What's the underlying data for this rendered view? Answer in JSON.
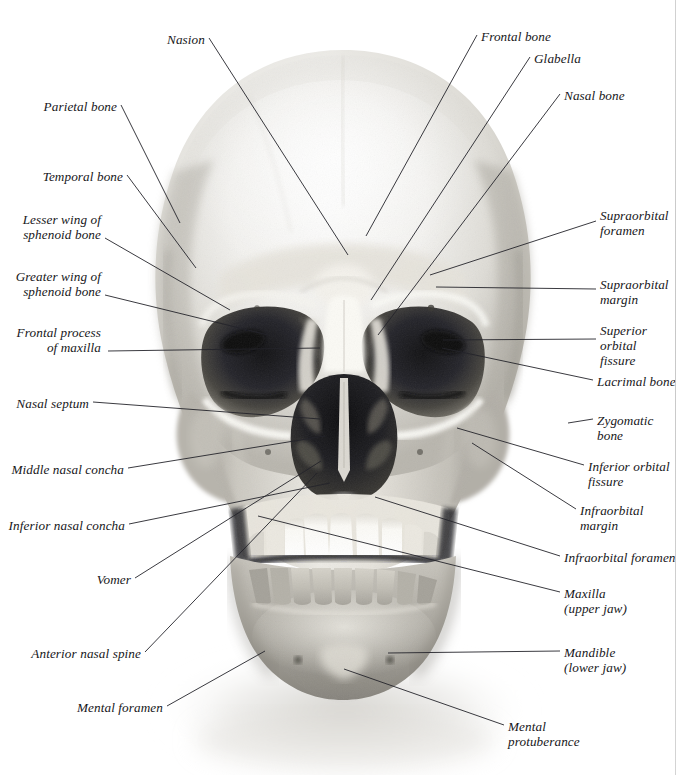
{
  "figure": {
    "view": "anterior (front) view",
    "medium": "black-and-white photograph",
    "page_rule_color": "#c9c9c9",
    "background_color": "#ffffff",
    "label_text_color": "#17171a",
    "leader_line_color": "#24242a"
  },
  "labels": [
    {
      "id": "nasion",
      "text": "Nasion",
      "side": "left",
      "x": 205,
      "y": 32,
      "align": "right",
      "lines": [
        "Nasion"
      ],
      "leader": [
        [
          209,
          38
        ],
        [
          348,
          255
        ]
      ]
    },
    {
      "id": "frontal-bone",
      "text": "Frontal bone",
      "side": "right",
      "x": 481,
      "y": 29,
      "align": "left",
      "lines": [
        "Frontal bone"
      ],
      "leader": [
        [
          477,
          35
        ],
        [
          366,
          236
        ]
      ]
    },
    {
      "id": "glabella",
      "text": "Glabella",
      "side": "right",
      "x": 534,
      "y": 51,
      "align": "left",
      "lines": [
        "Glabella"
      ],
      "leader": [
        [
          530,
          57
        ],
        [
          371,
          300
        ]
      ]
    },
    {
      "id": "nasal-bone",
      "text": "Nasal bone",
      "side": "right",
      "x": 564,
      "y": 88,
      "align": "left",
      "lines": [
        "Nasal bone"
      ],
      "leader": [
        [
          560,
          94
        ],
        [
          378,
          335
        ]
      ]
    },
    {
      "id": "parietal-bone",
      "text": "Parietal bone",
      "side": "left",
      "x": 117,
      "y": 99,
      "align": "right",
      "lines": [
        "Parietal bone"
      ],
      "leader": [
        [
          121,
          105
        ],
        [
          180,
          223
        ]
      ]
    },
    {
      "id": "temporal-bone",
      "text": "Temporal bone",
      "side": "left",
      "x": 123,
      "y": 169,
      "align": "right",
      "lines": [
        "Temporal bone"
      ],
      "leader": [
        [
          127,
          175
        ],
        [
          196,
          268
        ]
      ]
    },
    {
      "id": "supraorbital-foramen",
      "text": "Supraorbital foramen",
      "side": "right",
      "x": 600,
      "y": 208,
      "align": "left",
      "lines": [
        "Supraorbital",
        "foramen"
      ],
      "leader": [
        [
          596,
          221
        ],
        [
          430,
          275
        ]
      ]
    },
    {
      "id": "lesser-wing-sphenoid",
      "text": "Lesser wing of sphenoid bone",
      "side": "left",
      "x": 101,
      "y": 212,
      "align": "right",
      "lines": [
        "Lesser wing of",
        "sphenoid bone"
      ],
      "leader": [
        [
          105,
          238
        ],
        [
          230,
          310
        ]
      ]
    },
    {
      "id": "supraorbital-margin",
      "text": "Supraorbital margin",
      "side": "right",
      "x": 600,
      "y": 277,
      "align": "left",
      "lines": [
        "Supraorbital",
        "margin"
      ],
      "leader": [
        [
          596,
          289
        ],
        [
          436,
          287
        ]
      ]
    },
    {
      "id": "greater-wing-sphenoid",
      "text": "Greater wing of sphenoid bone",
      "side": "left",
      "x": 101,
      "y": 269,
      "align": "right",
      "lines": [
        "Greater wing of",
        "sphenoid bone"
      ],
      "leader": [
        [
          105,
          295
        ],
        [
          268,
          335
        ]
      ]
    },
    {
      "id": "superior-orbital-fissure",
      "text": "Superior orbital fissure",
      "side": "right",
      "x": 600,
      "y": 323,
      "align": "left",
      "lines": [
        "Superior",
        "orbital",
        "fissure"
      ],
      "leader": [
        [
          596,
          339
        ],
        [
          443,
          340
        ]
      ]
    },
    {
      "id": "frontal-process-maxilla",
      "text": "Frontal process of maxilla",
      "side": "left",
      "x": 101,
      "y": 325,
      "align": "right",
      "lines": [
        "Frontal process",
        "of maxilla"
      ],
      "leader": [
        [
          108,
          351
        ],
        [
          320,
          348
        ]
      ]
    },
    {
      "id": "lacrimal-bone",
      "text": "Lacrimal bone",
      "side": "right",
      "x": 597,
      "y": 374,
      "align": "left",
      "lines": [
        "Lacrimal bone"
      ],
      "leader": [
        [
          593,
          380
        ],
        [
          442,
          348
        ]
      ]
    },
    {
      "id": "nasal-septum",
      "text": "Nasal septum",
      "side": "left",
      "x": 89,
      "y": 396,
      "align": "right",
      "lines": [
        "Nasal septum"
      ],
      "leader": [
        [
          93,
          402
        ],
        [
          320,
          419
        ]
      ]
    },
    {
      "id": "zygomatic-bone",
      "text": "Zygomatic bone",
      "side": "right",
      "x": 597,
      "y": 413,
      "align": "left",
      "lines": [
        "Zygomatic",
        "bone"
      ],
      "leader": [
        [
          593,
          419
        ],
        [
          568,
          423
        ]
      ]
    },
    {
      "id": "inferior-orbital-fissure",
      "text": "Inferior orbital fissure",
      "side": "right",
      "x": 588,
      "y": 459,
      "align": "left",
      "lines": [
        "Inferior orbital",
        "fissure"
      ],
      "leader": [
        [
          584,
          465
        ],
        [
          457,
          428
        ]
      ]
    },
    {
      "id": "middle-nasal-concha",
      "text": "Middle nasal concha",
      "side": "left",
      "x": 124,
      "y": 462,
      "align": "right",
      "lines": [
        "Middle nasal concha"
      ],
      "leader": [
        [
          128,
          468
        ],
        [
          325,
          436
        ]
      ]
    },
    {
      "id": "infraorbital-margin",
      "text": "Infraorbital margin",
      "side": "right",
      "x": 580,
      "y": 503,
      "align": "left",
      "lines": [
        "Infraorbital",
        "margin"
      ],
      "leader": [
        [
          576,
          509
        ],
        [
          472,
          443
        ]
      ]
    },
    {
      "id": "inferior-nasal-concha",
      "text": "Inferior nasal concha",
      "side": "left",
      "x": 125,
      "y": 518,
      "align": "right",
      "lines": [
        "Inferior nasal concha"
      ],
      "leader": [
        [
          129,
          524
        ],
        [
          330,
          483
        ]
      ]
    },
    {
      "id": "infraorbital-foramen",
      "text": "Infraorbital foramen",
      "side": "right",
      "x": 564,
      "y": 550,
      "align": "left",
      "lines": [
        "Infraorbital foramen"
      ],
      "leader": [
        [
          560,
          556
        ],
        [
          375,
          497
        ]
      ]
    },
    {
      "id": "vomer",
      "text": "Vomer",
      "side": "left",
      "x": 131,
      "y": 572,
      "align": "right",
      "lines": [
        "Vomer"
      ],
      "leader": [
        [
          135,
          578
        ],
        [
          321,
          461
        ]
      ]
    },
    {
      "id": "maxilla",
      "text": "Maxilla (upper jaw)",
      "side": "right",
      "x": 564,
      "y": 586,
      "align": "left",
      "lines": [
        "Maxilla",
        "(upper jaw)"
      ],
      "leader": [
        [
          560,
          592
        ],
        [
          258,
          516
        ]
      ]
    },
    {
      "id": "anterior-nasal-spine",
      "text": "Anterior nasal spine",
      "side": "left",
      "x": 141,
      "y": 646,
      "align": "right",
      "lines": [
        "Anterior nasal spine"
      ],
      "leader": [
        [
          145,
          652
        ],
        [
          317,
          473
        ]
      ]
    },
    {
      "id": "mandible",
      "text": "Mandible (lower jaw)",
      "side": "right",
      "x": 564,
      "y": 645,
      "align": "left",
      "lines": [
        "Mandible",
        "(lower jaw)"
      ],
      "leader": [
        [
          560,
          651
        ],
        [
          388,
          653
        ]
      ]
    },
    {
      "id": "mental-foramen",
      "text": "Mental foramen",
      "side": "left",
      "x": 163,
      "y": 700,
      "align": "right",
      "lines": [
        "Mental foramen"
      ],
      "leader": [
        [
          167,
          706
        ],
        [
          265,
          651
        ]
      ]
    },
    {
      "id": "mental-protuberance",
      "text": "Mental protuberance",
      "side": "right",
      "x": 508,
      "y": 719,
      "align": "left",
      "lines": [
        "Mental",
        "protuberance"
      ],
      "leader": [
        [
          504,
          725
        ],
        [
          344,
          669
        ]
      ]
    }
  ]
}
